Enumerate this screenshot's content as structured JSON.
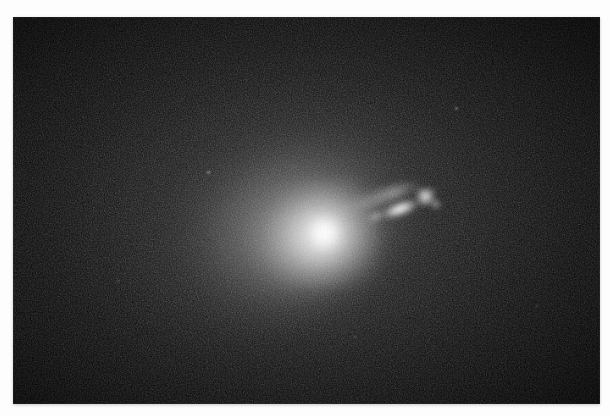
{
  "page": {
    "background_color": "#fdfdfd",
    "width": 610,
    "height": 416
  },
  "figure": {
    "type": "astronomical-photograph",
    "caption": "",
    "plate": {
      "x": 13,
      "y": 17,
      "width": 587,
      "height": 387,
      "background_color": "#070707",
      "colorspace": "grayscale"
    },
    "objects": [
      {
        "name": "galaxy-halo",
        "label": "Elliptical galaxy halo",
        "center_x": 275,
        "center_y": 205,
        "major_axis": 450,
        "minor_axis": 350,
        "position_angle_deg": -18,
        "peak_color": "#ededed"
      },
      {
        "name": "galaxy-nucleus",
        "label": "Nucleus",
        "center_x": 311,
        "center_y": 216,
        "radius": 19,
        "peak_color": "#ffffff"
      },
      {
        "name": "jet",
        "label": "Relativistic jet",
        "origin_x": 326,
        "origin_y": 194,
        "length": 86,
        "position_angle_deg": -19,
        "peak_color": "#ffffff"
      },
      {
        "name": "jet-knot-main",
        "label": "Jet knot A",
        "center_x": 387,
        "center_y": 192,
        "peak_color": "#ffffff"
      },
      {
        "name": "jet-knot-outer",
        "label": "Jet knot B",
        "center_x": 412,
        "center_y": 180,
        "peak_color": "#ffffff"
      }
    ],
    "field_stars": [
      {
        "name": "field-star-1",
        "x": 208,
        "y": 172,
        "size": 3
      },
      {
        "name": "field-star-2",
        "x": 456,
        "y": 108,
        "size": 3
      },
      {
        "name": "field-star-3",
        "x": 537,
        "y": 306,
        "size": 2
      },
      {
        "name": "field-star-4",
        "x": 118,
        "y": 281,
        "size": 2
      },
      {
        "name": "field-star-5",
        "x": 355,
        "y": 337,
        "size": 2
      }
    ]
  }
}
